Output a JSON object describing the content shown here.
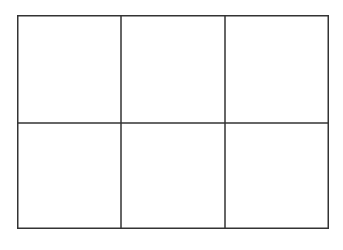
{
  "diagram": {
    "type": "grid",
    "rows": 2,
    "columns": 3,
    "cells": [
      {
        "row": 0,
        "col": 0,
        "label": ""
      },
      {
        "row": 0,
        "col": 1,
        "label": ""
      },
      {
        "row": 0,
        "col": 2,
        "label": ""
      },
      {
        "row": 1,
        "col": 0,
        "label": ""
      },
      {
        "row": 1,
        "col": 1,
        "label": ""
      },
      {
        "row": 1,
        "col": 2,
        "label": ""
      }
    ],
    "line_color": "#333333",
    "background": "#ffffff"
  }
}
